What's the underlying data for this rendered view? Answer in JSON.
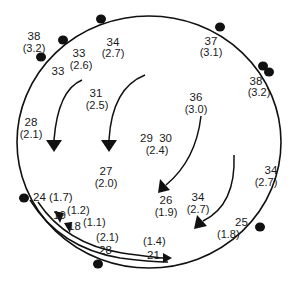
{
  "diagram": {
    "background": "#ffffff",
    "line_color": "#111111",
    "boundary": {
      "shape": "ellipse",
      "cx": 149,
      "cy": 142,
      "rx": 132,
      "ry": 126
    },
    "stations": [
      {
        "x": 41,
        "y": 57
      },
      {
        "x": 63,
        "y": 40
      },
      {
        "x": 101,
        "y": 19
      },
      {
        "x": 220,
        "y": 27
      },
      {
        "x": 263,
        "y": 67
      },
      {
        "x": 268,
        "y": 72
      },
      {
        "x": 24,
        "y": 198
      },
      {
        "x": 97,
        "y": 265
      },
      {
        "x": 260,
        "y": 227
      }
    ],
    "labels": [
      {
        "value": "38",
        "sub": "(3.2)",
        "x": 34,
        "y": 40
      },
      {
        "value": "34",
        "sub": "(2.7)",
        "x": 113,
        "y": 46
      },
      {
        "value": "33",
        "sub": "(2.6)",
        "x": 79,
        "y": 57
      },
      {
        "value": "33",
        "sub": "",
        "x": 58,
        "y": 75
      },
      {
        "value": "37",
        "sub": "(3.1)",
        "x": 210,
        "y": 45
      },
      {
        "value": "38",
        "sub": "(3.2)",
        "x": 256,
        "y": 84
      },
      {
        "value": "31",
        "sub": "(2.5)",
        "x": 96,
        "y": 98
      },
      {
        "value": "36",
        "sub": "(3.0)",
        "x": 196,
        "y": 102
      },
      {
        "value": "28",
        "sub": "(2.1)",
        "x": 30,
        "y": 126
      },
      {
        "value": "29  30",
        "sub": "(2.4)",
        "x": 156,
        "y": 142
      },
      {
        "value": "27",
        "sub": "(2.0)",
        "x": 106,
        "y": 176
      },
      {
        "value": "26",
        "sub": "(1.9)",
        "x": 164,
        "y": 205
      },
      {
        "value": "34",
        "sub": "(2.7)",
        "x": 198,
        "y": 202
      },
      {
        "value": "34",
        "sub": "(2.7)",
        "x": 270,
        "y": 175
      }
    ],
    "inline_labels": [
      {
        "text": "24 (1.7)",
        "x": 33,
        "y": 201
      },
      {
        "text": "19",
        "x": 53,
        "y": 219
      },
      {
        "text": "(1.2)",
        "x": 68,
        "y": 214
      },
      {
        "text": "18",
        "x": 68,
        "y": 230
      },
      {
        "text": "(1.1)",
        "x": 84,
        "y": 226
      },
      {
        "text": "(2.1)",
        "x": 96,
        "y": 241
      },
      {
        "text": "28",
        "x": 99,
        "y": 255
      },
      {
        "text": "(1.4)",
        "x": 143,
        "y": 245
      },
      {
        "text": "21",
        "x": 147,
        "y": 259
      },
      {
        "text": "25",
        "x": 235,
        "y": 226
      },
      {
        "text": "(1.8)",
        "x": 217,
        "y": 239
      }
    ]
  }
}
